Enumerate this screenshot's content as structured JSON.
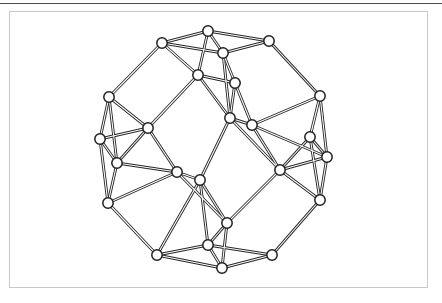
{
  "figure": {
    "frame": {
      "border_color": "#c9c9c9",
      "background_color": "#ffffff",
      "x": 9,
      "y": 11,
      "width": 419,
      "height": 277
    },
    "top_rule": {
      "color": "#4a4a4a",
      "y": 3,
      "thickness": 1
    },
    "style": {
      "edge_color": "#262626",
      "edge_highlight_color": "#ffffff",
      "vertex_fill": "#ffffff",
      "vertex_stroke": "#1f1f1f",
      "vertex_radius": 5.2,
      "edge_width": 2.9
    }
  },
  "chart_data": {
    "type": "diagram",
    "node_count": 32,
    "edge_count": 56,
    "nodes": [
      {
        "id": 0,
        "label": "t1",
        "x": 208,
        "y": 31
      },
      {
        "id": 1,
        "label": "t2",
        "x": 269,
        "y": 41
      },
      {
        "id": 2,
        "label": "t3",
        "x": 223,
        "y": 53
      },
      {
        "id": 3,
        "label": "t4",
        "x": 162,
        "y": 43
      },
      {
        "id": 4,
        "label": "ul1",
        "x": 109,
        "y": 97
      },
      {
        "id": 5,
        "label": "ul2",
        "x": 100,
        "y": 139
      },
      {
        "id": 6,
        "label": "ul3",
        "x": 117,
        "y": 163
      },
      {
        "id": 7,
        "label": "ul4",
        "x": 108,
        "y": 203
      },
      {
        "id": 8,
        "label": "ur1",
        "x": 320,
        "y": 96
      },
      {
        "id": 9,
        "label": "ur2",
        "x": 310,
        "y": 137
      },
      {
        "id": 10,
        "label": "ur3",
        "x": 327,
        "y": 157
      },
      {
        "id": 11,
        "label": "ur4",
        "x": 320,
        "y": 200
      },
      {
        "id": 12,
        "label": "b1",
        "x": 208,
        "y": 245
      },
      {
        "id": 13,
        "label": "b2",
        "x": 157,
        "y": 255
      },
      {
        "id": 14,
        "label": "b3",
        "x": 222,
        "y": 268
      },
      {
        "id": 15,
        "label": "b4",
        "x": 272,
        "y": 255
      },
      {
        "id": 16,
        "label": "c1",
        "x": 230,
        "y": 118
      },
      {
        "id": 17,
        "label": "c2",
        "x": 252,
        "y": 125
      },
      {
        "id": 18,
        "label": "c3",
        "x": 177,
        "y": 172
      },
      {
        "id": 19,
        "label": "c4",
        "x": 200,
        "y": 180
      },
      {
        "id": 20,
        "label": "c5",
        "x": 148,
        "y": 128
      },
      {
        "id": 21,
        "label": "c6",
        "x": 280,
        "y": 170
      },
      {
        "id": 22,
        "label": "c7",
        "x": 227,
        "y": 223
      },
      {
        "id": 23,
        "label": "m1",
        "x": 198,
        "y": 75
      },
      {
        "id": 24,
        "label": "m2",
        "x": 235,
        "y": 83
      }
    ],
    "edges": [
      [
        0,
        1
      ],
      [
        0,
        2
      ],
      [
        0,
        3
      ],
      [
        1,
        2
      ],
      [
        2,
        3
      ],
      [
        3,
        4
      ],
      [
        1,
        8
      ],
      [
        4,
        5
      ],
      [
        4,
        6
      ],
      [
        5,
        6
      ],
      [
        5,
        7
      ],
      [
        6,
        7
      ],
      [
        8,
        9
      ],
      [
        8,
        10
      ],
      [
        9,
        10
      ],
      [
        9,
        11
      ],
      [
        10,
        11
      ],
      [
        7,
        13
      ],
      [
        11,
        15
      ],
      [
        12,
        13
      ],
      [
        12,
        14
      ],
      [
        12,
        15
      ],
      [
        13,
        14
      ],
      [
        14,
        15
      ],
      [
        23,
        3
      ],
      [
        23,
        0
      ],
      [
        23,
        20
      ],
      [
        23,
        16
      ],
      [
        24,
        2
      ],
      [
        24,
        16
      ],
      [
        24,
        17
      ],
      [
        16,
        17
      ],
      [
        16,
        19
      ],
      [
        16,
        21
      ],
      [
        17,
        21
      ],
      [
        17,
        10
      ],
      [
        20,
        4
      ],
      [
        20,
        6
      ],
      [
        20,
        18
      ],
      [
        18,
        19
      ],
      [
        18,
        6
      ],
      [
        18,
        22
      ],
      [
        19,
        22
      ],
      [
        19,
        12
      ],
      [
        21,
        22
      ],
      [
        21,
        9
      ],
      [
        21,
        10
      ],
      [
        22,
        12
      ],
      [
        22,
        14
      ],
      [
        23,
        24
      ],
      [
        20,
        5
      ],
      [
        18,
        7
      ],
      [
        21,
        11
      ],
      [
        16,
        2
      ],
      [
        19,
        13
      ],
      [
        17,
        8
      ]
    ]
  }
}
